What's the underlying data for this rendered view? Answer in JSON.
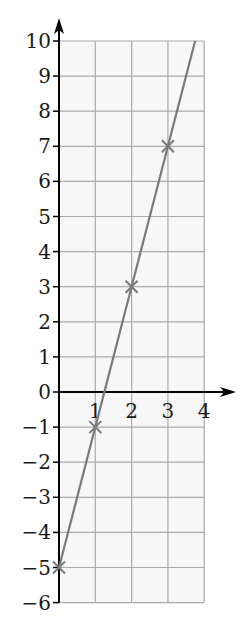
{
  "chart_data": {
    "type": "line",
    "title": "",
    "xlabel": "",
    "ylabel": "",
    "xlim": [
      0,
      4
    ],
    "ylim": [
      -6,
      10
    ],
    "grid": true,
    "x_ticks": [
      "1",
      "2",
      "3",
      "4"
    ],
    "y_ticks": [
      "10",
      "9",
      "8",
      "7",
      "6",
      "5",
      "4",
      "3",
      "2",
      "1",
      "0",
      "-1",
      "-2",
      "-3",
      "-4",
      "-5",
      "-6"
    ],
    "series": [
      {
        "name": "y = 4x - 5",
        "line_extends_to": {
          "x": 3.75,
          "y": 10
        },
        "points": [
          {
            "x": 0,
            "y": -5
          },
          {
            "x": 1,
            "y": -1
          },
          {
            "x": 2,
            "y": 3
          },
          {
            "x": 3,
            "y": 7
          }
        ],
        "marker": "x",
        "color": "#7a7a7a"
      }
    ],
    "colors": {
      "grid": "#aaaaaa",
      "axis": "#000000",
      "plot_bg": "#f7f7f7"
    }
  }
}
